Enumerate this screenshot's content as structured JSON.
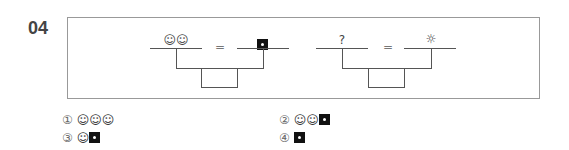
{
  "question": {
    "number": "04",
    "diagrams": [
      {
        "left_top": "☺☺",
        "equals": "=",
        "right_top": "■"
      },
      {
        "left_top": "?",
        "equals": "=",
        "right_top": "☼"
      }
    ]
  },
  "options": [
    {
      "marker": "①",
      "content": "☺☺☺"
    },
    {
      "marker": "②",
      "content": "☺☺■"
    },
    {
      "marker": "③",
      "content": "☺■"
    },
    {
      "marker": "④",
      "content": "■"
    }
  ]
}
